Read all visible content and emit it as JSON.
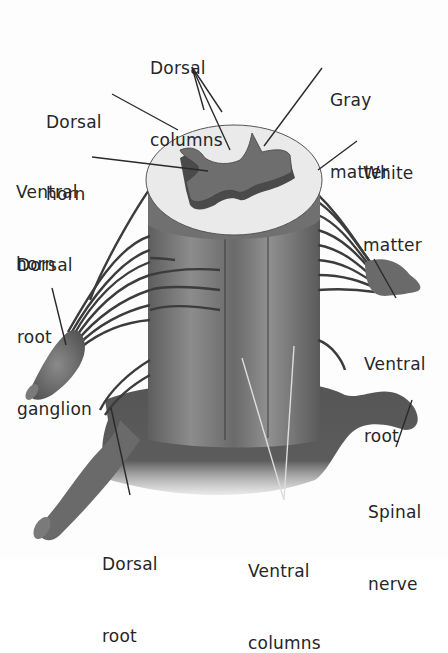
{
  "diagram": {
    "labels": {
      "dorsal_columns": {
        "line1": "Dorsal",
        "line2": "columns"
      },
      "gray_matter": {
        "line1": "Gray",
        "line2": "matter"
      },
      "dorsal_horn": {
        "line1": "Dorsal",
        "line2": "horn"
      },
      "white_matter": {
        "line1": "White",
        "line2": "matter"
      },
      "ventral_horn": {
        "line1": "Ventral",
        "line2": "horn"
      },
      "dorsal_root_ganglion": {
        "line1": "Dorsal",
        "line2": "root",
        "line3": "ganglion"
      },
      "ventral_root": {
        "line1": "Ventral",
        "line2": "root"
      },
      "spinal_nerve": {
        "line1": "Spinal",
        "line2": "nerve"
      },
      "dorsal_root": {
        "line1": "Dorsal",
        "line2": "root"
      },
      "ventral_columns": {
        "line1": "Ventral",
        "line2": "columns"
      }
    },
    "colors": {
      "gray_matter": "#6e6e6e",
      "gray_matter_side": "#4a4a4a",
      "white_matter_top": "#e9e9e9",
      "column_body": "#7a7a7a",
      "column_highlight": "#9a9a9a",
      "nerve_fiber": "#3c3c3c",
      "leader_line": "#2a2a2a",
      "label_text": "#262626"
    }
  }
}
